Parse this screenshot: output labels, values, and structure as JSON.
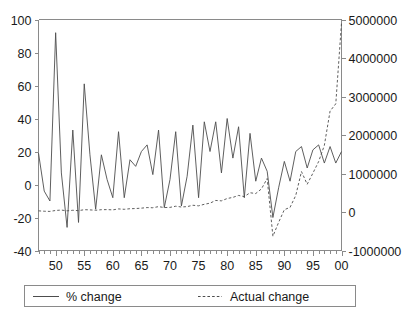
{
  "chart_data": {
    "type": "line",
    "title": "",
    "subtitle": "",
    "xlabel": "",
    "ylabel": "",
    "y2label": "",
    "grid": false,
    "legend_position": "bottom",
    "xlim": [
      1947,
      2000
    ],
    "x_tick_labels": [
      "50",
      "55",
      "60",
      "65",
      "70",
      "75",
      "80",
      "85",
      "90",
      "95",
      "00"
    ],
    "x_tick_values": [
      1950,
      1955,
      1960,
      1965,
      1970,
      1975,
      1980,
      1985,
      1990,
      1995,
      2000
    ],
    "x_minor_tick_step": 1,
    "ylim": [
      -40,
      100
    ],
    "y_tick_labels": [
      "-40",
      "-20",
      "0",
      "20",
      "40",
      "60",
      "80",
      "100"
    ],
    "y_tick_values": [
      -40,
      -20,
      0,
      20,
      40,
      60,
      80,
      100
    ],
    "y2lim": [
      -1000000,
      5000000
    ],
    "y2_tick_labels": [
      "-1000000",
      "0",
      "1000000",
      "2000000",
      "3000000",
      "4000000",
      "5000000"
    ],
    "y2_tick_values": [
      -1000000,
      0,
      1000000,
      2000000,
      3000000,
      4000000,
      5000000
    ],
    "x": [
      1947,
      1948,
      1949,
      1950,
      1951,
      1952,
      1953,
      1954,
      1955,
      1956,
      1957,
      1958,
      1959,
      1960,
      1961,
      1962,
      1963,
      1964,
      1965,
      1966,
      1967,
      1968,
      1969,
      1970,
      1971,
      1972,
      1973,
      1974,
      1975,
      1976,
      1977,
      1978,
      1979,
      1980,
      1981,
      1982,
      1983,
      1984,
      1985,
      1986,
      1987,
      1988,
      1989,
      1990,
      1991,
      1992,
      1993,
      1994,
      1995,
      1996,
      1997,
      1998,
      1999,
      2000
    ],
    "series": [
      {
        "name": "% change",
        "axis": "left",
        "style": "solid",
        "values": [
          19,
          -4,
          -10,
          92,
          7,
          -26,
          33,
          -23,
          61,
          18,
          -15,
          18,
          3,
          -8,
          32,
          -8,
          15,
          11,
          20,
          24,
          6,
          33,
          -14,
          3,
          32,
          -13,
          5,
          36,
          -8,
          38,
          20,
          38,
          7,
          40,
          16,
          35,
          -8,
          31,
          2,
          16,
          8,
          -20,
          -2,
          14,
          2,
          20,
          23,
          10,
          21,
          24,
          13,
          23,
          13,
          20
        ]
      },
      {
        "name": "Actual change",
        "axis": "right",
        "style": "dashed",
        "values": [
          30000,
          20000,
          15000,
          40000,
          50000,
          30000,
          45000,
          35000,
          60000,
          55000,
          45000,
          60000,
          62000,
          55000,
          80000,
          70000,
          85000,
          90000,
          100000,
          115000,
          110000,
          140000,
          115000,
          120000,
          150000,
          130000,
          140000,
          175000,
          160000,
          200000,
          230000,
          300000,
          290000,
          350000,
          380000,
          430000,
          400000,
          500000,
          480000,
          600000,
          870000,
          -630000,
          -270000,
          60000,
          120000,
          430000,
          1050000,
          720000,
          1010000,
          1310000,
          1730000,
          2620000,
          2810000,
          4910000
        ]
      }
    ]
  },
  "legend": {
    "entries": [
      {
        "label": "% change",
        "style": "solid"
      },
      {
        "label": "Actual change",
        "style": "dashed"
      }
    ]
  }
}
